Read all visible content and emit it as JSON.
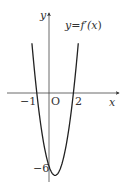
{
  "chart_data": {
    "type": "line",
    "title": "",
    "function_label": "y=f′(x)",
    "xlabel": "x",
    "ylabel": "y",
    "origin_label": "O",
    "x_tick_labels": [
      "-1",
      "2"
    ],
    "y_tick_labels": [
      "-6"
    ],
    "series": [
      {
        "name": "y=f'(x)",
        "formula": "3x^2 - 3x - 6",
        "x": [
          -1.4,
          -1.0,
          -0.5,
          0.0,
          0.5,
          1.0,
          1.5,
          2.0,
          2.4
        ],
        "values": [
          4.08,
          0.0,
          -3.75,
          -6.0,
          -6.75,
          -6.0,
          -3.75,
          0.0,
          3.88
        ]
      }
    ],
    "roots": [
      -1,
      2
    ],
    "y_intercept": -6,
    "xlim": [
      -3.5,
      5.8
    ],
    "ylim": [
      -7.3,
      6.5
    ],
    "grid": false,
    "legend": "none"
  },
  "labels": {
    "y_axis": "y",
    "x_axis": "x",
    "origin": "O",
    "neg_one": "−1",
    "two": "2",
    "neg_six": "−6",
    "func_y": "y",
    "func_eq": "=",
    "func_f": "f′(",
    "func_x": "x",
    "func_close": ")"
  },
  "colors": {
    "curve": "#222222",
    "axis": "#444444",
    "text": "#333333"
  }
}
